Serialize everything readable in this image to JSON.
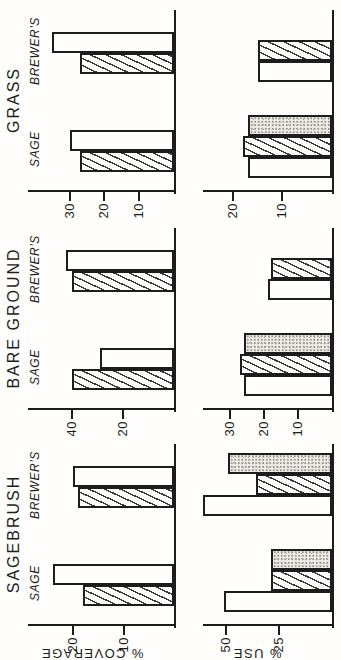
{
  "figure": {
    "background": "#fffefd",
    "ink_color": "#1c1c1c",
    "stipple_fill": "#edebe5"
  },
  "chart_data": {
    "type": "bar",
    "layout": {
      "rotated_ccw_90_on_page": true,
      "grid": false,
      "legend": "none",
      "columns_order": "left-to-right in unrotated orientation",
      "bar_patterns": [
        "open",
        "hatched",
        "stippled"
      ]
    },
    "columns": [
      "SAGEBRUSH",
      "BARE GROUND",
      "GRASS"
    ],
    "group_labels": [
      "SAGE",
      "BREWER'S"
    ],
    "rows": [
      {
        "ylabel": "% COVERAGE",
        "panels": [
          {
            "column": "SAGEBRUSH",
            "yticks": [
              10,
              20
            ],
            "ylim": [
              0,
              29
            ],
            "series": [
              {
                "name": "hatched",
                "pattern": "hatched",
                "values": [
                  18,
                  19
                ]
              },
              {
                "name": "open",
                "pattern": "open",
                "values": [
                  24,
                  20
                ]
              }
            ]
          },
          {
            "column": "BARE GROUND",
            "yticks": [
              20,
              40
            ],
            "ylim": [
              0,
              57
            ],
            "series": [
              {
                "name": "hatched",
                "pattern": "hatched",
                "values": [
                  40,
                  40
                ]
              },
              {
                "name": "open",
                "pattern": "open",
                "values": [
                  29,
                  42
                ]
              }
            ]
          },
          {
            "column": "GRASS",
            "yticks": [
              10,
              20,
              30
            ],
            "ylim": [
              0,
              42
            ],
            "series": [
              {
                "name": "hatched",
                "pattern": "hatched",
                "values": [
                  27,
                  27
                ]
              },
              {
                "name": "open",
                "pattern": "open",
                "values": [
                  30,
                  35
                ]
              }
            ]
          }
        ]
      },
      {
        "ylabel": "% USE",
        "panels": [
          {
            "column": "SAGEBRUSH",
            "yticks": [
              25,
              50
            ],
            "ylim": [
              0,
              61
            ],
            "series": [
              {
                "name": "open",
                "pattern": "open",
                "values": [
                  51,
                  61
                ]
              },
              {
                "name": "hatched",
                "pattern": "hatched",
                "values": [
                  29,
                  36
                ]
              },
              {
                "name": "stippled",
                "pattern": "stippled",
                "values": [
                  29,
                  49
                ]
              }
            ]
          },
          {
            "column": "BARE GROUND",
            "yticks": [
              10,
              20,
              30
            ],
            "ylim": [
              0,
              38
            ],
            "series": [
              {
                "name": "open",
                "pattern": "open",
                "values": [
                  26,
                  19
                ]
              },
              {
                "name": "hatched",
                "pattern": "hatched",
                "values": [
                  27,
                  18
                ]
              },
              {
                "name": "stippled",
                "pattern": "stippled",
                "values": [
                  26,
                  null
                ]
              }
            ]
          },
          {
            "column": "GRASS",
            "yticks": [
              10,
              20
            ],
            "ylim": [
              0,
              26
            ],
            "series": [
              {
                "name": "open",
                "pattern": "open",
                "values": [
                  17,
                  15
                ]
              },
              {
                "name": "hatched",
                "pattern": "hatched",
                "values": [
                  18,
                  15
                ]
              },
              {
                "name": "stippled",
                "pattern": "stippled",
                "values": [
                  17,
                  null
                ]
              }
            ]
          }
        ]
      }
    ]
  }
}
